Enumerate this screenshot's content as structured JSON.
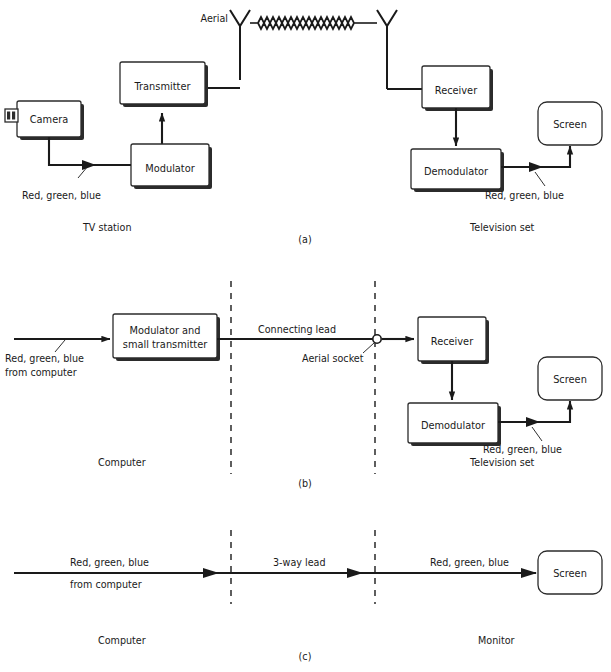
{
  "figure": {
    "background_color": "#ffffff",
    "line_color": "#1a1a1a"
  },
  "panels": [
    {
      "id": "a",
      "caption": "(a)",
      "zone_labels": {
        "left": "TV station",
        "right": "Television set"
      },
      "blocks": [
        {
          "name": "camera",
          "label": "Camera",
          "shape": "camera"
        },
        {
          "name": "transmitter",
          "label": "Transmitter",
          "shape": "shadow-box"
        },
        {
          "name": "modulator",
          "label": "Modulator",
          "shape": "shadow-box"
        },
        {
          "name": "receiver",
          "label": "Receiver",
          "shape": "shadow-box"
        },
        {
          "name": "demodulator",
          "label": "Demodulator",
          "shape": "shadow-box"
        },
        {
          "name": "screen",
          "label": "Screen",
          "shape": "rounded-box"
        }
      ],
      "annotations": [
        {
          "name": "aerial-label",
          "text": "Aerial"
        },
        {
          "name": "signal-label-left",
          "text": "Red, green, blue"
        },
        {
          "name": "signal-label-right",
          "text": "Red, green, blue"
        }
      ],
      "icons": [
        {
          "name": "aerial-transmit-icon",
          "text": "dipole-aerial"
        },
        {
          "name": "aerial-receive-icon",
          "text": "dipole-aerial"
        },
        {
          "name": "radio-wave-icon",
          "text": "zigzag-wave"
        }
      ]
    },
    {
      "id": "b",
      "caption": "(b)",
      "zone_labels": {
        "left": "Computer",
        "right": "Television set"
      },
      "blocks": [
        {
          "name": "modulator-small-transmitter",
          "label_line1": "Modulator and",
          "label_line2": "small transmitter",
          "shape": "shadow-box"
        },
        {
          "name": "receiver",
          "label": "Receiver",
          "shape": "shadow-box"
        },
        {
          "name": "demodulator",
          "label": "Demodulator",
          "shape": "shadow-box"
        },
        {
          "name": "screen",
          "label": "Screen",
          "shape": "rounded-box"
        }
      ],
      "annotations": [
        {
          "name": "input-label-line1",
          "text": "Red, green, blue"
        },
        {
          "name": "input-label-line2",
          "text": "from computer"
        },
        {
          "name": "connecting-lead-label",
          "text": "Connecting lead"
        },
        {
          "name": "aerial-socket-label",
          "text": "Aerial socket"
        },
        {
          "name": "signal-label-right",
          "text": "Red, green, blue"
        }
      ],
      "icons": [
        {
          "name": "aerial-socket-icon",
          "text": "open-circle"
        }
      ]
    },
    {
      "id": "c",
      "caption": "(c)",
      "zone_labels": {
        "left": "Computer",
        "right": "Monitor"
      },
      "blocks": [
        {
          "name": "screen",
          "label": "Screen",
          "shape": "rounded-box"
        }
      ],
      "annotations": [
        {
          "name": "input-label-line1",
          "text": "Red, green, blue"
        },
        {
          "name": "input-label-line2",
          "text": "from computer"
        },
        {
          "name": "lead-label",
          "text": "3-way lead"
        },
        {
          "name": "signal-label-right",
          "text": "Red, green, blue"
        }
      ]
    }
  ],
  "text": {
    "aerial": "Aerial",
    "rgb": "Red, green, blue",
    "from_computer": "from computer",
    "tv_station": "TV station",
    "television_set": "Television set",
    "computer": "Computer",
    "monitor": "Monitor",
    "camera": "Camera",
    "transmitter": "Transmitter",
    "modulator": "Modulator",
    "receiver": "Receiver",
    "demodulator": "Demodulator",
    "screen": "Screen",
    "modulator_and": "Modulator and",
    "small_transmitter": "small transmitter",
    "connecting_lead": "Connecting lead",
    "aerial_socket": "Aerial socket",
    "three_way_lead": "3-way lead",
    "caption_a": "(a)",
    "caption_b": "(b)",
    "caption_c": "(c)"
  }
}
